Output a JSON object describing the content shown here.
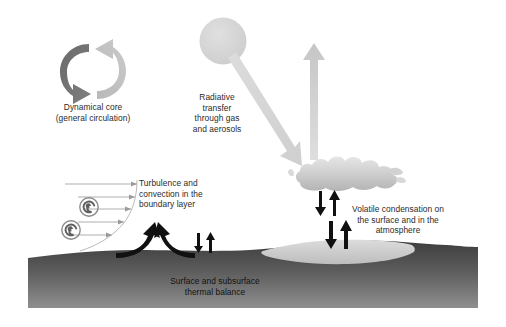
{
  "figure": {
    "background_color": "#ffffff",
    "width": 506,
    "height": 327
  },
  "labels": {
    "dynamical_core": "Dynamical core\n(general circulation)",
    "radiative_transfer": "Radiative\ntransfer\nthrough gas\nand aerosols",
    "turbulence": "Turbulence and\nconvection in the\nboundary layer",
    "volatile_condensation": "Volatile condensation on\nthe surface and in the\natmosphere",
    "surface_thermal": "Surface and subsurface\nthermal balance"
  },
  "elements": {
    "sun": {
      "name": "sun-disk",
      "color": "#d6d6d6"
    },
    "incoming_beam": {
      "name": "incoming-solar-radiation-arrow",
      "color": "#d9d9d9",
      "direction": "down-right"
    },
    "outgoing_beam": {
      "name": "outgoing-radiation-arrow",
      "color": "#cfcfcf",
      "direction": "up"
    },
    "cloud": {
      "name": "cloud",
      "color": "#cccccc"
    },
    "ground": {
      "name": "ground-mass",
      "color_top": "#3a3a3a",
      "color_bottom": "#8c8c8c"
    },
    "frost_patch": {
      "name": "surface-frost-deposit",
      "color": "#d4d4d4"
    },
    "circulation_arrow_dark": {
      "name": "circulation-arrow-dark",
      "color": "#6e6e6e"
    },
    "circulation_arrow_light": {
      "name": "circulation-arrow-light",
      "color": "#c4c4c4"
    },
    "convection_plumes": {
      "name": "convection-plume-arrows",
      "color": "#111111",
      "count": 2
    },
    "exchange_arrows_bare": {
      "name": "surface-exchange-arrows-bare",
      "color": "#111111",
      "count": 2
    },
    "exchange_arrows_frost": {
      "name": "surface-exchange-arrows-frost",
      "color": "#111111",
      "count": 2
    },
    "exchange_arrows_cloud": {
      "name": "cloud-exchange-arrows",
      "color": "#111111",
      "count": 2
    },
    "eddies": {
      "name": "turbulent-eddy-spirals",
      "color": "#7d7d7d",
      "count": 2
    },
    "wind_profile": {
      "name": "boundary-layer-wind-profile-arrows",
      "color": "#9a9a9a",
      "count": 5
    }
  }
}
